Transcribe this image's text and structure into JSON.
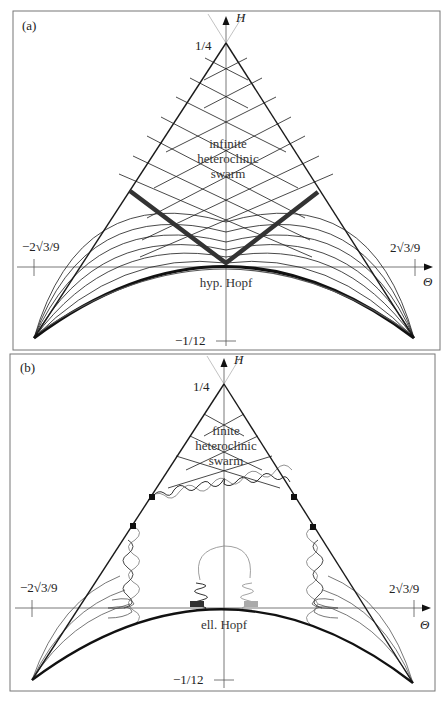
{
  "figure": {
    "panels": [
      {
        "id": "a",
        "panel_label": "(a)",
        "y_axis_label": "H",
        "x_axis_label": "Θ",
        "apex_label": "1/4",
        "bottom_label": "−1/12",
        "left_tick_label": "−2√3/9",
        "right_tick_label": "2√3/9",
        "region_label_lines": [
          "infinite",
          "heteroclinic",
          "swarm"
        ],
        "curve_label": "hyp. Hopf"
      },
      {
        "id": "b",
        "panel_label": "(b)",
        "y_axis_label": "H",
        "x_axis_label": "Θ",
        "apex_label": "1/4",
        "bottom_label": "−1/12",
        "left_tick_label": "−2√3/9",
        "right_tick_label": "2√3/9",
        "region_label_lines": [
          "finite",
          "heteroclinic",
          "swarm"
        ],
        "curve_label": "ell. Hopf"
      }
    ],
    "colors": {
      "line": "#1a1a1a",
      "thick_band": "#3a3a3a",
      "grey_curve": "#888888",
      "axis": "#555555",
      "border": "#777777"
    }
  }
}
